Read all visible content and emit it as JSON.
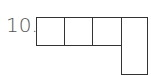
{
  "problem": {
    "number_label": "10.",
    "shape": {
      "description": "polyomino of 4 squares in a row with one extra square below the rightmost",
      "cells": [
        {
          "row": 0,
          "col": 0
        },
        {
          "row": 0,
          "col": 1
        },
        {
          "row": 0,
          "col": 2
        },
        {
          "row": 0,
          "col": 3,
          "tall": true
        }
      ]
    },
    "colors": {
      "line": "#333333",
      "label": "#555555",
      "background": "#ffffff"
    }
  }
}
